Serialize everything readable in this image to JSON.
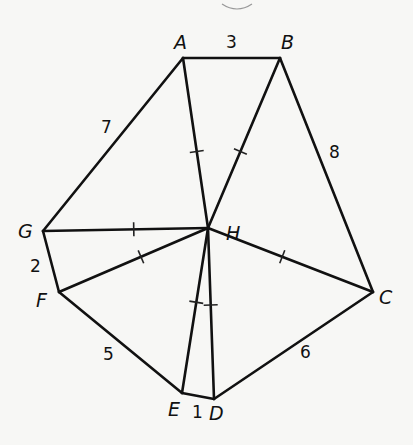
{
  "diagram": {
    "type": "geometry-figure",
    "center": "H",
    "vertices": [
      {
        "id": "A",
        "label": "A",
        "x": 183,
        "y": 58,
        "lx": 174,
        "ly": 49
      },
      {
        "id": "B",
        "label": "B",
        "x": 280,
        "y": 58,
        "lx": 281,
        "ly": 49
      },
      {
        "id": "C",
        "label": "C",
        "x": 373,
        "y": 292,
        "lx": 379,
        "ly": 304
      },
      {
        "id": "D",
        "label": "D",
        "x": 214,
        "y": 399,
        "lx": 209,
        "ly": 420
      },
      {
        "id": "E",
        "label": "E",
        "x": 182,
        "y": 393,
        "lx": 168,
        "ly": 416
      },
      {
        "id": "F",
        "label": "F",
        "x": 59,
        "y": 292,
        "lx": 36,
        "ly": 307
      },
      {
        "id": "G",
        "label": "G",
        "x": 43,
        "y": 231,
        "lx": 18,
        "ly": 238
      },
      {
        "id": "H",
        "label": "H",
        "x": 208,
        "y": 228,
        "lx": 226,
        "ly": 240
      }
    ],
    "perimeter_edges": [
      {
        "from": "A",
        "to": "B",
        "length": "3",
        "lx": 226,
        "ly": 48
      },
      {
        "from": "B",
        "to": "C",
        "length": "8",
        "lx": 329,
        "ly": 158
      },
      {
        "from": "C",
        "to": "D",
        "length": "6",
        "lx": 300,
        "ly": 358
      },
      {
        "from": "D",
        "to": "E",
        "length": "1",
        "lx": 192,
        "ly": 418
      },
      {
        "from": "E",
        "to": "F",
        "length": "5",
        "lx": 103,
        "ly": 360
      },
      {
        "from": "F",
        "to": "G",
        "length": "2",
        "lx": 30,
        "ly": 272
      },
      {
        "from": "G",
        "to": "A",
        "length": "7",
        "lx": 101,
        "ly": 133
      }
    ],
    "radial_edges": [
      {
        "from": "H",
        "to": "A",
        "tick_marks": 1
      },
      {
        "from": "H",
        "to": "B",
        "tick_marks": 1
      },
      {
        "from": "H",
        "to": "C",
        "tick_marks": 1
      },
      {
        "from": "H",
        "to": "D",
        "tick_marks": 1
      },
      {
        "from": "H",
        "to": "E",
        "tick_marks": 1
      },
      {
        "from": "H",
        "to": "F",
        "tick_marks": 1
      },
      {
        "from": "H",
        "to": "G",
        "tick_marks": 1
      }
    ],
    "note": "All segments from H to the vertices are marked congruent"
  }
}
